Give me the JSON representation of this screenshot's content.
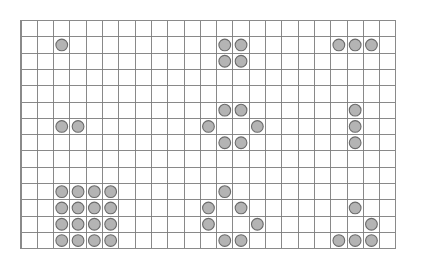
{
  "board": {
    "title": "token-grid-board",
    "background_color": "#ffffff",
    "grid": {
      "origin_x": 21,
      "origin_y": 20.5,
      "cell_size": 16.3,
      "columns": 23,
      "rows": 14,
      "line_color": "#7c7c7c",
      "border_color": "#8a8a8a",
      "show_grid": true
    },
    "token_style": {
      "fill_color": "#b4b4b4",
      "stroke_color": "#6b6b6b",
      "radius_cells": 0.36
    },
    "token_count": 40,
    "groups": [
      {
        "name": "single-token-top-left",
        "label": "1",
        "count": 1,
        "cells": [
          [
            2,
            1
          ]
        ]
      },
      {
        "name": "square-block-top-center",
        "label": "4",
        "count": 4,
        "cells": [
          [
            12,
            1
          ],
          [
            13,
            1
          ],
          [
            12,
            2
          ],
          [
            13,
            2
          ]
        ]
      },
      {
        "name": "row-triple-top-right",
        "label": "3",
        "count": 3,
        "cells": [
          [
            19,
            1
          ],
          [
            20,
            1
          ],
          [
            21,
            1
          ]
        ]
      },
      {
        "name": "pair-middle-left",
        "label": "2",
        "count": 2,
        "cells": [
          [
            2,
            6
          ],
          [
            3,
            6
          ]
        ]
      },
      {
        "name": "ring-middle-center",
        "label": "6",
        "count": 6,
        "cells": [
          [
            12,
            5
          ],
          [
            13,
            5
          ],
          [
            11,
            6
          ],
          [
            14,
            6
          ],
          [
            12,
            7
          ],
          [
            13,
            7
          ]
        ]
      },
      {
        "name": "column-triple-middle-right",
        "label": "3",
        "count": 3,
        "cells": [
          [
            20,
            5
          ],
          [
            20,
            6
          ],
          [
            20,
            7
          ]
        ]
      },
      {
        "name": "block-4x4-bottom-left",
        "label": "16",
        "count": 16,
        "cells": [
          [
            2,
            10
          ],
          [
            3,
            10
          ],
          [
            4,
            10
          ],
          [
            5,
            10
          ],
          [
            2,
            11
          ],
          [
            3,
            11
          ],
          [
            4,
            11
          ],
          [
            5,
            11
          ],
          [
            2,
            12
          ],
          [
            3,
            12
          ],
          [
            4,
            12
          ],
          [
            5,
            12
          ],
          [
            2,
            13
          ],
          [
            3,
            13
          ],
          [
            4,
            13
          ],
          [
            5,
            13
          ]
        ]
      },
      {
        "name": "scatter-bottom-center",
        "label": "7",
        "count": 7,
        "cells": [
          [
            12,
            10
          ],
          [
            11,
            11
          ],
          [
            13,
            11
          ],
          [
            11,
            12
          ],
          [
            14,
            12
          ],
          [
            12,
            13
          ],
          [
            13,
            13
          ]
        ]
      },
      {
        "name": "scatter-bottom-right",
        "label": "5",
        "count": 5,
        "cells": [
          [
            20,
            11
          ],
          [
            21,
            12
          ],
          [
            19,
            13
          ],
          [
            20,
            13
          ],
          [
            21,
            13
          ]
        ]
      }
    ]
  }
}
